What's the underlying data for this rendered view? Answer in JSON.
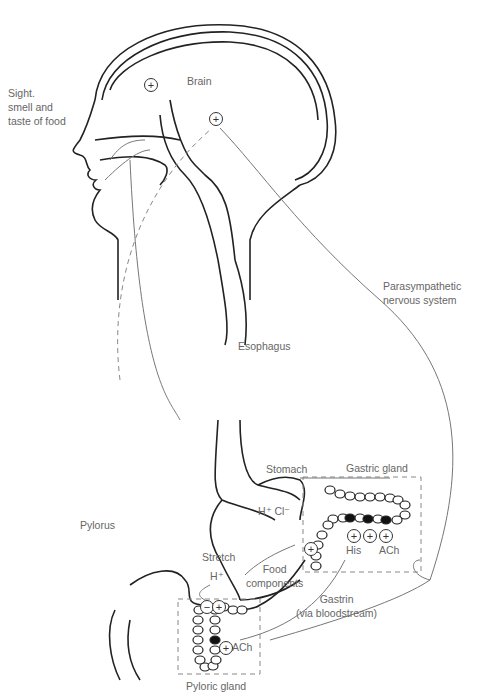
{
  "labels": {
    "sight": [
      "Sight.",
      "smell and",
      "taste of food"
    ],
    "brain": "Brain",
    "parasympathetic": [
      "Parasympathetic",
      "nervous system"
    ],
    "esophagus": "Esophagus",
    "stomach": "Stomach",
    "gastric_gland": "Gastric gland",
    "hcl": "H⁺ Cl⁻",
    "pylorus": "Pylorus",
    "stretch": "Stretch",
    "h_plus": "H⁺",
    "food_components": [
      "Food",
      "components"
    ],
    "his": "His",
    "ach_gastric": "ACh",
    "gastrin": [
      "Gastrin",
      "(via bloodstream)"
    ],
    "ach_pyloric": "ACh",
    "pyloric_gland": "Pyloric gland"
  },
  "symbols": {
    "plus": "+",
    "minus": "−"
  }
}
